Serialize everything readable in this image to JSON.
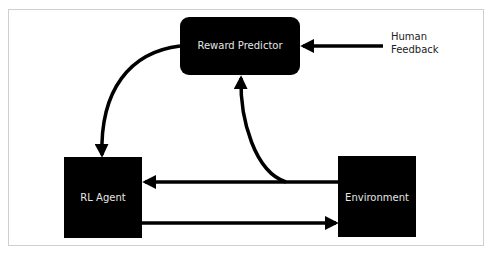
{
  "diagram": {
    "nodes": {
      "reward_predictor": {
        "label": "Reward Predictor"
      },
      "rl_agent": {
        "label": "RL Agent"
      },
      "environment": {
        "label": "Environment"
      }
    },
    "external_input": {
      "label_line1": "Human",
      "label_line2": "Feedback"
    },
    "edges": [
      {
        "from": "Human Feedback",
        "to": "Reward Predictor"
      },
      {
        "from": "Reward Predictor",
        "to": "RL Agent"
      },
      {
        "from": "Environment",
        "to": "RL Agent"
      },
      {
        "from": "Environment",
        "to": "Reward Predictor"
      },
      {
        "from": "RL Agent",
        "to": "Environment"
      }
    ],
    "colors": {
      "node_fill": "#000000",
      "node_text": "#e6e6e6",
      "arrow": "#000000",
      "frame_border": "#cfcfcf"
    }
  }
}
